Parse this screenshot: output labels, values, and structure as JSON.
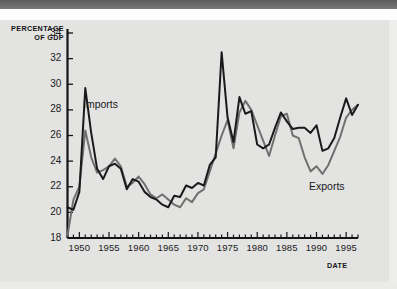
{
  "axes": {
    "y_title_line1": "PERCENTAGE",
    "y_title_line2": "OF GDP",
    "x_title": "DATE"
  },
  "series_labels": {
    "imports": "Imports",
    "exports": "Exports"
  },
  "colors": {
    "imports": "#1a1a1c",
    "exports": "#707070",
    "axis": "#141416",
    "background": "#e3e3e1",
    "top_band": "#6b6b6b"
  },
  "chart_data": {
    "type": "line",
    "title": "",
    "xlabel": "DATE",
    "ylabel": "PERCENTAGE OF GDP",
    "xlim": [
      1948,
      1997
    ],
    "ylim": [
      18,
      34
    ],
    "yticks": [
      18,
      20,
      22,
      24,
      26,
      28,
      30,
      32,
      34
    ],
    "xticks": [
      1950,
      1955,
      1960,
      1965,
      1970,
      1975,
      1980,
      1985,
      1990,
      1995
    ],
    "xtick_minor_step": 1,
    "grid": false,
    "legend": "inline-annotations",
    "x": [
      1948,
      1949,
      1950,
      1951,
      1952,
      1953,
      1954,
      1955,
      1956,
      1957,
      1958,
      1959,
      1960,
      1961,
      1962,
      1963,
      1964,
      1965,
      1966,
      1967,
      1968,
      1969,
      1970,
      1971,
      1972,
      1973,
      1974,
      1975,
      1976,
      1977,
      1978,
      1979,
      1980,
      1981,
      1982,
      1983,
      1984,
      1985,
      1986,
      1987,
      1988,
      1989,
      1990,
      1991,
      1992,
      1993,
      1994,
      1995,
      1996,
      1997
    ],
    "series": [
      {
        "name": "Imports",
        "color": "#1a1a1c",
        "values": [
          20.4,
          20.2,
          21.6,
          29.7,
          26.2,
          23.4,
          22.6,
          23.6,
          23.8,
          23.4,
          21.8,
          22.6,
          22.4,
          21.6,
          21.2,
          21.0,
          20.6,
          20.4,
          21.3,
          21.2,
          22.1,
          21.9,
          22.3,
          22.1,
          23.7,
          24.3,
          32.5,
          27.4,
          25.5,
          29.0,
          27.7,
          27.9,
          25.3,
          25.0,
          25.3,
          26.6,
          27.8,
          27.1,
          26.5,
          26.6,
          26.6,
          26.2,
          26.8,
          24.8,
          25.0,
          25.8,
          27.4,
          28.9,
          27.6,
          28.4
        ]
      },
      {
        "name": "Exports",
        "color": "#707070",
        "values": [
          18.2,
          21.0,
          22.0,
          26.4,
          24.3,
          23.1,
          23.3,
          23.6,
          24.2,
          23.6,
          22.0,
          22.3,
          22.8,
          22.2,
          21.4,
          21.1,
          21.4,
          21.0,
          20.6,
          20.4,
          21.1,
          20.8,
          21.5,
          21.8,
          23.2,
          24.6,
          26.0,
          27.2,
          25.0,
          27.8,
          28.7,
          28.0,
          26.8,
          25.6,
          24.4,
          26.0,
          27.5,
          27.7,
          26.0,
          25.8,
          24.3,
          23.2,
          23.6,
          23.0,
          23.7,
          24.8,
          25.9,
          27.4,
          28.0,
          28.4
        ]
      }
    ]
  }
}
